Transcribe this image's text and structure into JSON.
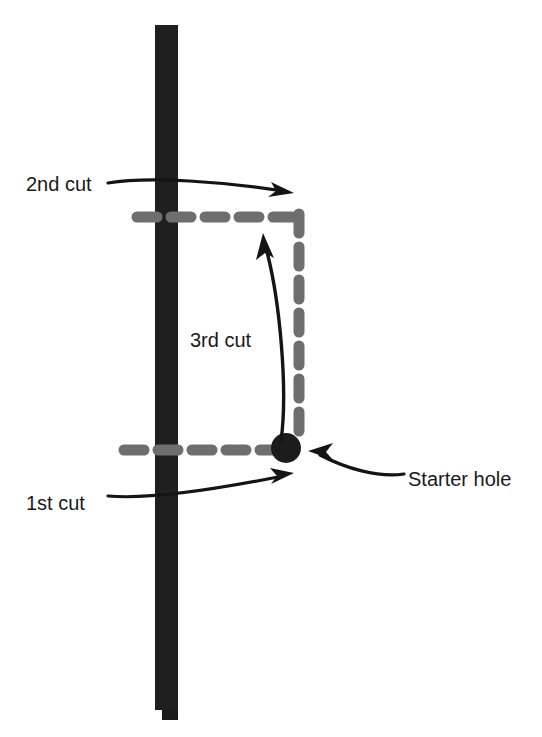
{
  "diagram": {
    "type": "instructional-line-diagram",
    "colors": {
      "background": "#ffffff",
      "stud": "#1c1c1c",
      "cut_line": "#6e6e6e",
      "arrow": "#141414",
      "text": "#1a1a1a",
      "starter_hole": "#1c1c1c"
    },
    "stud": {
      "name": "vertical-stud",
      "x": 155,
      "y": 25,
      "width": 23,
      "height": 695,
      "notch_label": "bottom-notch"
    },
    "starter_hole": {
      "label": "Starter hole",
      "cx": 286,
      "cy": 448,
      "r": 15
    },
    "cut_lines": [
      {
        "name": "first-cut-line",
        "orientation": "horizontal",
        "x1": 124,
        "x2": 288,
        "y": 450
      },
      {
        "name": "second-cut-line",
        "orientation": "horizontal",
        "x1": 137,
        "x2": 302,
        "y": 217
      },
      {
        "name": "third-cut-line",
        "orientation": "vertical",
        "x": 299,
        "y1": 214,
        "y2": 442
      }
    ],
    "labels": {
      "first_cut": "1st cut",
      "second_cut": "2nd cut",
      "third_cut": "3rd cut",
      "starter_hole": "Starter hole"
    },
    "label_positions": {
      "first_cut": {
        "x": 26,
        "y": 510
      },
      "second_cut": {
        "x": 26,
        "y": 191
      },
      "third_cut": {
        "x": 190,
        "y": 347
      },
      "starter_hole": {
        "x": 408,
        "y": 486
      }
    },
    "annotations": [
      {
        "name": "first-cut-pointer",
        "label": "1st cut",
        "direction": "right",
        "from": {
          "x": 108,
          "y": 496
        },
        "to": {
          "x": 292,
          "y": 474
        }
      },
      {
        "name": "second-cut-pointer",
        "label": "2nd cut",
        "direction": "right",
        "from": {
          "x": 108,
          "y": 183
        },
        "to": {
          "x": 292,
          "y": 193
        }
      },
      {
        "name": "third-cut-pointer",
        "label": "3rd cut",
        "direction": "up",
        "from": {
          "x": 281,
          "y": 440
        },
        "to": {
          "x": 264,
          "y": 233
        }
      },
      {
        "name": "starter-hole-pointer",
        "label": "Starter hole",
        "direction": "left",
        "from": {
          "x": 404,
          "y": 473
        },
        "to": {
          "x": 309,
          "y": 452
        }
      }
    ]
  }
}
